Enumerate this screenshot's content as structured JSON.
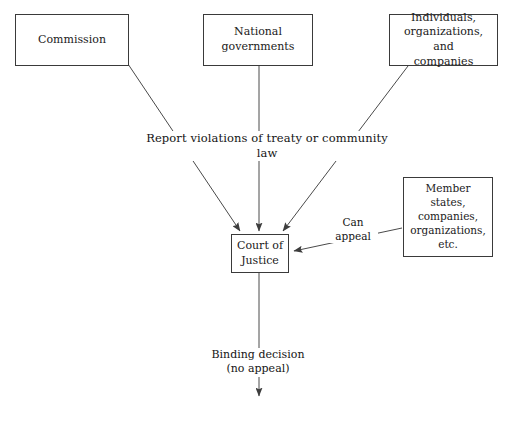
{
  "diagram": {
    "background_color": "#ffffff",
    "line_color": "#4a4a4a",
    "text_color": "#1a1a1a",
    "nodes": [
      {
        "id": "commission",
        "label": "Commission"
      },
      {
        "id": "national",
        "label": "National\ngovernments"
      },
      {
        "id": "individuals",
        "label": "Individuals,\norganizations, and\ncompanies"
      },
      {
        "id": "member_states",
        "label": "Member\nstates,\ncompanies,\norganizations,\netc."
      },
      {
        "id": "court",
        "label": "Court of\nJustice"
      }
    ],
    "edge_labels": {
      "report": "Report violations of treaty or community law",
      "appeal": "Can\nappeal",
      "binding": "Binding decision\n(no appeal)"
    },
    "edges": [
      {
        "from": "commission",
        "to": "court",
        "label": "report",
        "arrow": "to"
      },
      {
        "from": "national",
        "to": "court",
        "label": "report",
        "arrow": "to"
      },
      {
        "from": "individuals",
        "to": "court",
        "label": "report",
        "arrow": "to"
      },
      {
        "from": "member_states",
        "to": "court",
        "label": "appeal",
        "arrow": "to"
      },
      {
        "from": "court",
        "to": "",
        "label": "binding",
        "arrow": "to"
      }
    ]
  }
}
